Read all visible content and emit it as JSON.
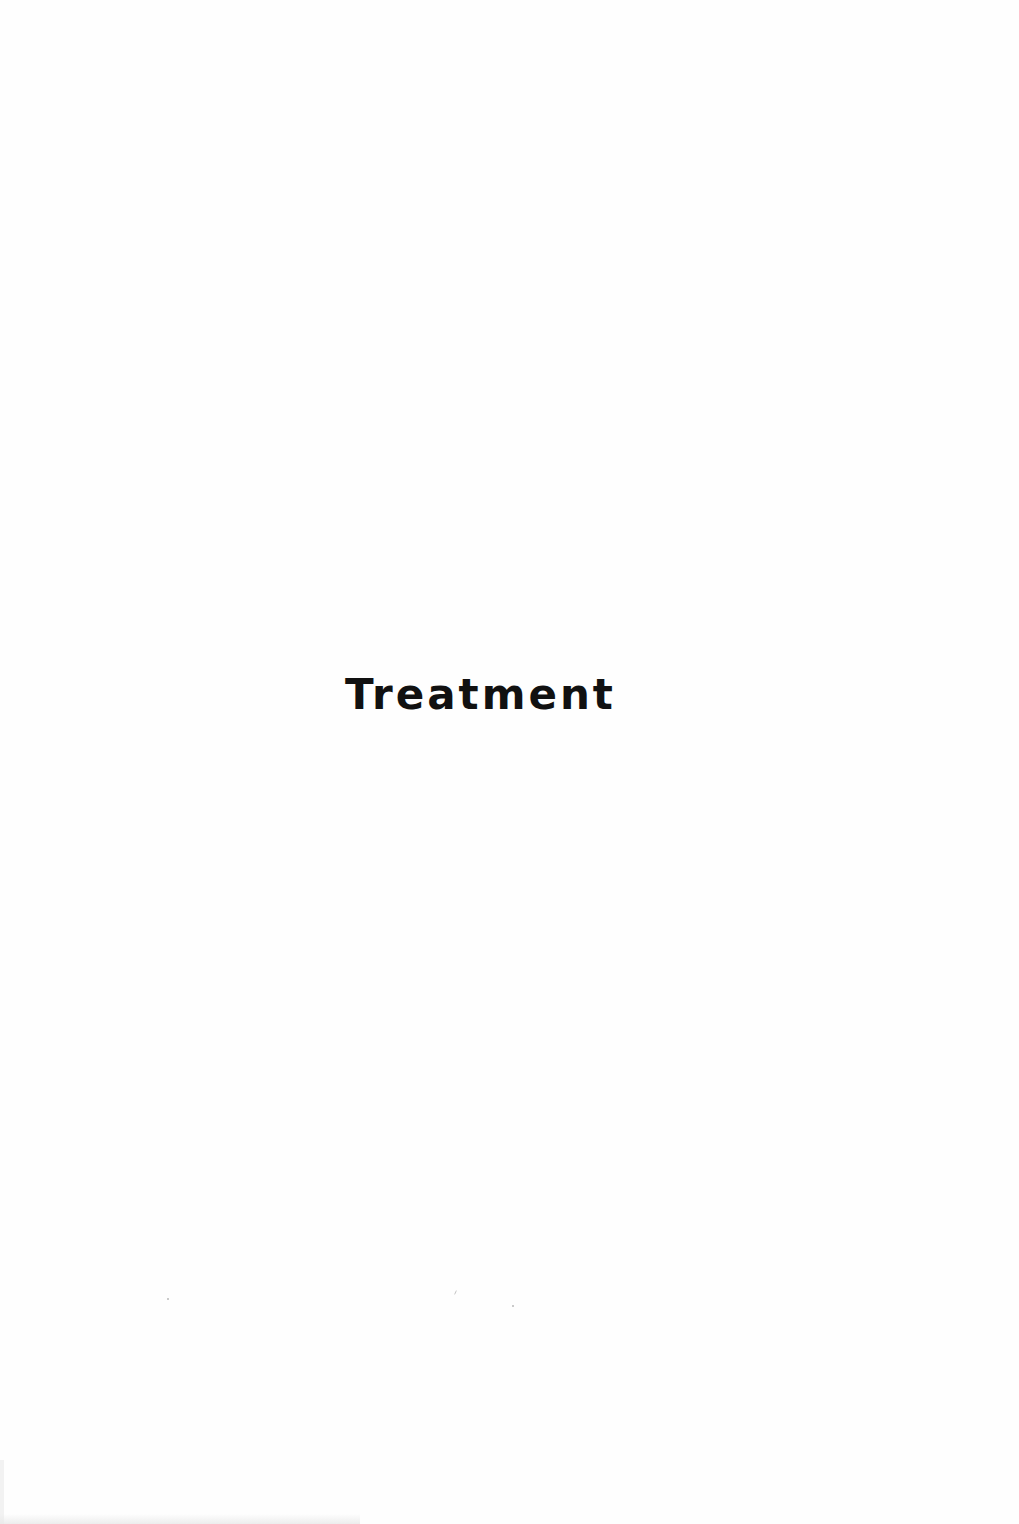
{
  "page": {
    "title": "Treatment",
    "background_color": "#fefefe",
    "text_color": "#111111"
  }
}
